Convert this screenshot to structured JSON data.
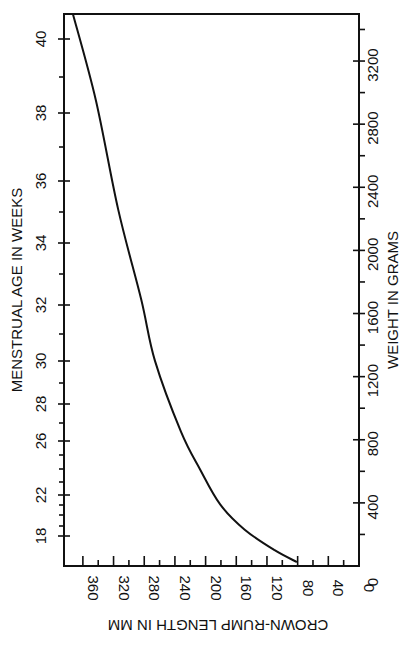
{
  "chart_data": {
    "type": "line",
    "title": "",
    "orientation": "rotated 90 degrees (vertical text)",
    "xlabel": "CROWN-RUMP LENGTH IN MM",
    "ylabel_left": "MENSTRUAL AGE IN WEEKS",
    "ylabel_right": "WEIGHT IN GRAMS",
    "x_axis": {
      "label": "CROWN-RUMP LENGTH IN MM",
      "range": [
        375,
        0
      ],
      "reversed": true,
      "major_ticks": [
        360,
        320,
        280,
        240,
        200,
        160,
        120,
        80,
        40,
        0
      ],
      "minor_step": 20
    },
    "left_axis": {
      "label": "MENSTRUAL AGE IN WEEKS",
      "scale": "non-linear",
      "tick_labels": [
        "18",
        "22",
        "26",
        "28",
        "30",
        "32",
        "34",
        "36",
        "38",
        "40"
      ],
      "ticks": [
        {
          "week": 18,
          "py": 536
        },
        {
          "week": 19,
          "py": 526
        },
        {
          "week": 20,
          "py": 515
        },
        {
          "week": 21,
          "py": 505
        },
        {
          "week": 22,
          "py": 495
        },
        {
          "week": 23,
          "py": 482
        },
        {
          "week": 24,
          "py": 469
        },
        {
          "week": 25,
          "py": 455
        },
        {
          "week": 26,
          "py": 441
        },
        {
          "week": 27,
          "py": 423
        },
        {
          "week": 28,
          "py": 404
        },
        {
          "week": 29,
          "py": 383
        },
        {
          "week": 30,
          "py": 361
        },
        {
          "week": 31,
          "py": 334
        },
        {
          "week": 32,
          "py": 305
        },
        {
          "week": 33,
          "py": 274
        },
        {
          "week": 34,
          "py": 243
        },
        {
          "week": 35,
          "py": 212
        },
        {
          "week": 36,
          "py": 181
        },
        {
          "week": 37,
          "py": 147
        },
        {
          "week": 38,
          "py": 113
        },
        {
          "week": 39,
          "py": 77
        },
        {
          "week": 40,
          "py": 39
        }
      ]
    },
    "right_axis": {
      "label": "WEIGHT IN GRAMS",
      "range": [
        0,
        3500
      ],
      "major_ticks": [
        400,
        800,
        1200,
        1600,
        2000,
        2400,
        2800,
        3200
      ],
      "tick_labels": [
        "0",
        "400",
        "800",
        "1200",
        "1600",
        "2000",
        "2400",
        "2800",
        "3200"
      ],
      "minor_step": 100
    },
    "series": [
      {
        "name": "Fetal growth curve",
        "points": [
          {
            "crl_mm": 373,
            "weight_g": 3500,
            "weeks": 40.7
          },
          {
            "crl_mm": 343,
            "weight_g": 2950,
            "weeks": 39.4
          },
          {
            "crl_mm": 314,
            "weight_g": 2260,
            "weeks": 35.9
          },
          {
            "crl_mm": 284,
            "weight_g": 1690,
            "weeks": 32.2
          },
          {
            "crl_mm": 266,
            "weight_g": 1300,
            "weeks": 30.0
          },
          {
            "crl_mm": 232,
            "weight_g": 850,
            "weeks": 26.5
          },
          {
            "crl_mm": 207,
            "weight_g": 610,
            "weeks": 24.0
          },
          {
            "crl_mm": 181,
            "weight_g": 390,
            "weeks": 22.0
          },
          {
            "crl_mm": 149,
            "weight_g": 230,
            "weeks": 19.8
          },
          {
            "crl_mm": 110,
            "weight_g": 100,
            "weeks": 17.6
          },
          {
            "crl_mm": 81,
            "weight_g": 25,
            "weeks": 16.5
          }
        ]
      }
    ],
    "grid": false,
    "legend": null
  },
  "labels": {
    "left_axis_title": "MENSTRUAL AGE IN WEEKS",
    "right_axis_title": "WEIGHT IN GRAMS",
    "bottom_axis_title": "CROWN-RUMP LENGTH IN MM",
    "left_ticks": [
      "40",
      "38",
      "36",
      "34",
      "32",
      "30",
      "28",
      "26",
      "22",
      "18"
    ],
    "right_ticks": [
      "3200",
      "2800",
      "2400",
      "2000",
      "1600",
      "1200",
      "800",
      "400"
    ],
    "bottom_ticks": [
      "360",
      "320",
      "280",
      "240",
      "200",
      "160",
      "120",
      "80",
      "40",
      "0"
    ]
  },
  "colors": {
    "ink": "#111111",
    "background": "#ffffff"
  }
}
